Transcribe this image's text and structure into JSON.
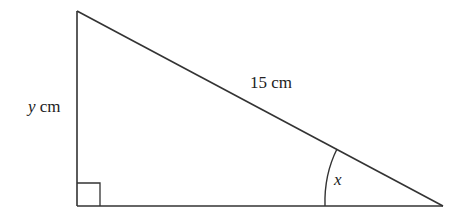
{
  "diagram": {
    "type": "right-triangle",
    "labels": {
      "hypotenuse": "15 cm",
      "vertical_side_var": "y",
      "vertical_side_unit": " cm",
      "angle": "x"
    },
    "colors": {
      "stroke": "#333333",
      "text": "#222222",
      "background": "#ffffff"
    },
    "vertices": {
      "top": [
        77,
        11
      ],
      "right_angle": [
        77,
        206
      ],
      "acute": [
        443,
        206
      ]
    }
  }
}
